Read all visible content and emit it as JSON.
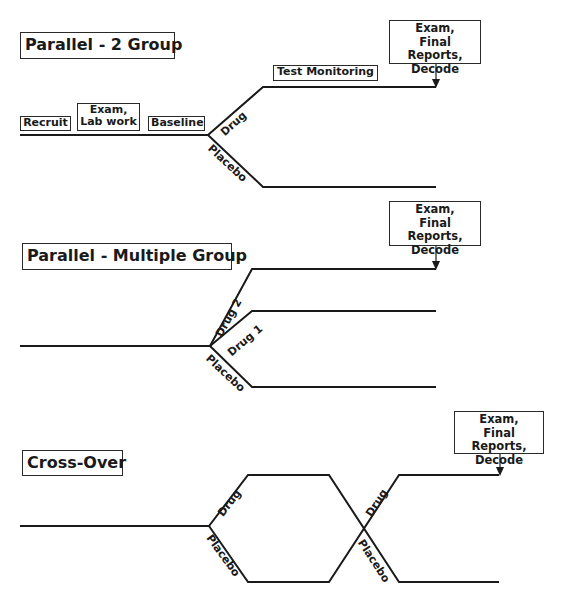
{
  "sections": [
    {
      "title": "Parallel - 2 Group",
      "phases": [
        "Recruit",
        "Exam,\nLab work",
        "Baseline"
      ],
      "monitoring": "Test Monitoring",
      "arms": [
        "Drug",
        "Placebo"
      ],
      "end_box": [
        "Exam,",
        "Final Reports,",
        "Decode"
      ]
    },
    {
      "title": "Parallel - Multiple Group",
      "arms": [
        "Drug 2",
        "Drug 1",
        "Placebo"
      ],
      "end_box": [
        "Exam,",
        "Final Reports,",
        "Decode"
      ]
    },
    {
      "title": "Cross-Over",
      "arms_period1": [
        "Drug",
        "Placebo"
      ],
      "arms_period2": [
        "Drug",
        "Placebo"
      ],
      "end_box": [
        "Exam,",
        "Final Reports,",
        "Decode"
      ]
    }
  ],
  "colors": {
    "line": "#1a1a1a",
    "background": "#ffffff"
  }
}
